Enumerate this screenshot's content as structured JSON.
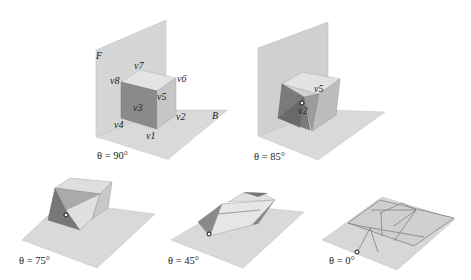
{
  "figure": {
    "panels": [
      {
        "id": "p90",
        "caption": "θ = 90°",
        "angle": 90
      },
      {
        "id": "p85",
        "caption": "θ = 85°",
        "angle": 85
      },
      {
        "id": "p75",
        "caption": "θ = 75°",
        "angle": 75
      },
      {
        "id": "p45",
        "caption": "θ = 45°",
        "angle": 45
      },
      {
        "id": "p0",
        "caption": "θ = 0°",
        "angle": 0
      }
    ],
    "labels": {
      "front_plane": "F",
      "base_plane": "B",
      "v1": "v1",
      "v2": "v2",
      "v3": "v3",
      "v4": "v4",
      "v5": "v5",
      "v6": "v6",
      "v7": "v7",
      "v8": "v8",
      "p85_v5": "v5",
      "p85_v2": "v2"
    },
    "colors": {
      "plane": "#d4d4d4",
      "plane_edge": "#b8b8b8",
      "face_light": "#e2e2e2",
      "face_mid": "#c4c4c4",
      "face_dark": "#8c8c8c",
      "face_darker": "#6e6e6e",
      "crease": "#7a7a7a"
    }
  }
}
